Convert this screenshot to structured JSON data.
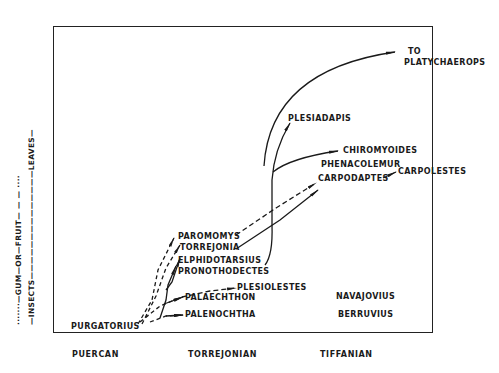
{
  "diet_axis": {
    "primary": "—INSECTS——————————————LEAVES—",
    "secondary": "·······—GUM—OR—FRUIT— — — ····",
    "labels": [
      "INSECTS",
      "GUM",
      "OR",
      "FRUIT",
      "LEAVES"
    ]
  },
  "periods": [
    "PUERCAN",
    "TORREJONIAN",
    "TIFFANIAN"
  ],
  "taxa": {
    "purgatorius": "PURGATORIUS",
    "paromomys": "PAROMOMYS",
    "torrejonia": "TORREJONIA",
    "elphidotarsius": "ELPHIDOTARSIUS",
    "pronothodectes": "PRONOTHODECTES",
    "plesiolestes": "PLESIOLESTES",
    "palaechthon": "PALAECHTHON",
    "palenochtha": "PALENOCHTHA",
    "navajovius": "NAVAJOVIUS",
    "berruvius": "BERRUVIUS",
    "plesiadapis": "PLESIADAPIS",
    "chiromyoides": "CHIROMYOIDES",
    "phenacolemur": "PHENACOLEMUR",
    "carpodaptes": "CARPODAPTES",
    "carpolestes": "CARPOLESTES",
    "to": "TO",
    "platychaerops": "PLATYCHAEROPS"
  },
  "colors": {
    "ink": "#1a1a1a",
    "background": "#ffffff"
  }
}
